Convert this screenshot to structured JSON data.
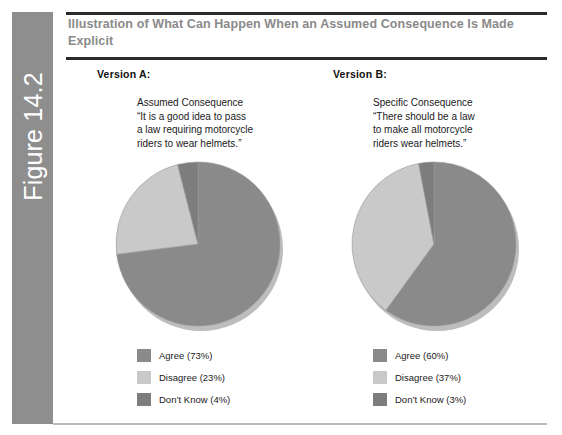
{
  "figure": {
    "number_label": "Figure 14.2",
    "title": "Illustration of What Can Happen When an Assumed Consequence Is Made Explicit",
    "title_line_1": "Illustration of What Can Happen When an Assumed Consequence",
    "title_line_2": "Is Made Explicit",
    "spine_color": "#8e8e8e",
    "title_color": "#8a8a8a",
    "rule_color": "#2b2b2b",
    "bottom_rule_color": "#b9b9b9"
  },
  "palette": {
    "agree": "#8a8a8a",
    "disagree": "#c9c9c9",
    "dont_know": "#7d7d7d",
    "pie_edge": "#9a9a9a",
    "shadow": "#bdbdbd"
  },
  "versions": [
    {
      "heading": "Version A:",
      "statement_label": "Assumed Consequence",
      "statement_lines": [
        "Assumed Consequence",
        "“It is a good idea to pass",
        "a law requiring motorcycle",
        "riders to wear helmets.”"
      ],
      "legend": [
        {
          "label": "Agree (73%)",
          "color": "#8a8a8a"
        },
        {
          "label": "Disagree (23%)",
          "color": "#c9c9c9"
        },
        {
          "label": "Don’t Know (4%)",
          "color": "#7d7d7d"
        }
      ]
    },
    {
      "heading": "Version B:",
      "statement_label": "Specific Consequence",
      "statement_lines": [
        "Specific Consequence",
        "“There should be a law",
        "to make all motorcycle",
        "riders wear helmets.”"
      ],
      "legend": [
        {
          "label": "Agree (60%)",
          "color": "#8a8a8a"
        },
        {
          "label": "Disagree (37%)",
          "color": "#c9c9c9"
        },
        {
          "label": "Don’t Know (3%)",
          "color": "#7d7d7d"
        }
      ]
    }
  ],
  "chart_data": [
    {
      "type": "pie",
      "title": "Version A: Assumed Consequence",
      "categories": [
        "Agree",
        "Disagree",
        "Don't Know"
      ],
      "values": [
        73,
        23,
        4
      ],
      "labels": [
        "Agree (73%)",
        "Disagree (23%)",
        "Don't Know (4%)"
      ],
      "colors": [
        "#8a8a8a",
        "#c9c9c9",
        "#7d7d7d"
      ],
      "units": "percent",
      "start_angle_deg": 0,
      "direction": "clockwise",
      "legend_position": "below",
      "grid": false
    },
    {
      "type": "pie",
      "title": "Version B: Specific Consequence",
      "categories": [
        "Agree",
        "Disagree",
        "Don't Know"
      ],
      "values": [
        60,
        37,
        3
      ],
      "labels": [
        "Agree (60%)",
        "Disagree (37%)",
        "Don't Know (3%)"
      ],
      "colors": [
        "#8a8a8a",
        "#c9c9c9",
        "#7d7d7d"
      ],
      "units": "percent",
      "start_angle_deg": 0,
      "direction": "clockwise",
      "legend_position": "below",
      "grid": false
    }
  ]
}
